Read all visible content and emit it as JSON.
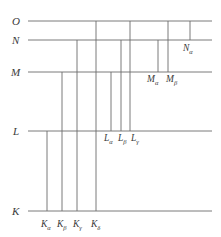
{
  "figure": {
    "type": "energy-level-transition-diagram",
    "background_color": "#ffffff",
    "line_color": "#6b6b6b",
    "text_color": "#3a3a3a"
  },
  "levels": [
    {
      "id": "O",
      "label": "O",
      "y": 21,
      "label_x": 12,
      "label_y": 16
    },
    {
      "id": "N",
      "label": "N",
      "y": 40,
      "label_x": 12,
      "label_y": 35
    },
    {
      "id": "M",
      "label": "M",
      "y": 72,
      "label_x": 11,
      "label_y": 67
    },
    {
      "id": "L",
      "label": "L",
      "y": 131,
      "label_x": 13,
      "label_y": 126
    },
    {
      "id": "K",
      "label": "K",
      "y": 211,
      "label_x": 12,
      "label_y": 206
    }
  ],
  "level_line": {
    "x_start": 28,
    "x_end": 212
  },
  "transitions": [
    {
      "id": "K-alpha",
      "series": "K",
      "greek": "α",
      "base": "K",
      "from": "L",
      "to": "K",
      "x": 47,
      "y_top": 131,
      "y_bottom": 211
    },
    {
      "id": "K-beta",
      "series": "K",
      "greek": "β",
      "base": "K",
      "from": "M",
      "to": "K",
      "x": 62,
      "y_top": 72,
      "y_bottom": 211
    },
    {
      "id": "K-gamma",
      "series": "K",
      "greek": "γ",
      "base": "K",
      "from": "N",
      "to": "K",
      "x": 77,
      "y_top": 40,
      "y_bottom": 211
    },
    {
      "id": "K-delta",
      "series": "K",
      "greek": "δ",
      "base": "K",
      "from": "O",
      "to": "K",
      "x": 96,
      "y_top": 21,
      "y_bottom": 211
    },
    {
      "id": "L-alpha",
      "series": "L",
      "greek": "α",
      "base": "L",
      "from": "M",
      "to": "L",
      "x": 111,
      "y_top": 72,
      "y_bottom": 131
    },
    {
      "id": "L-beta",
      "series": "L",
      "greek": "β",
      "base": "L",
      "from": "N",
      "to": "L",
      "x": 121,
      "y_top": 40,
      "y_bottom": 131
    },
    {
      "id": "L-gamma",
      "series": "L",
      "greek": "γ",
      "base": "L",
      "from": "O",
      "to": "L",
      "x": 130,
      "y_top": 21,
      "y_bottom": 131
    },
    {
      "id": "M-alpha",
      "series": "M",
      "greek": "α",
      "base": "M",
      "from": "N",
      "to": "M",
      "x": 158,
      "y_top": 40,
      "y_bottom": 72
    },
    {
      "id": "M-beta",
      "series": "M",
      "greek": "β",
      "base": "M",
      "from": "O",
      "to": "M",
      "x": 168,
      "y_top": 21,
      "y_bottom": 72
    },
    {
      "id": "N-alpha",
      "series": "N",
      "greek": "α",
      "base": "N",
      "from": "O",
      "to": "N",
      "x": 190,
      "y_top": 21,
      "y_bottom": 40
    }
  ],
  "transition_labels": [
    {
      "for": "K-alpha",
      "base": "K",
      "greek": "α",
      "x": 41,
      "y": 220
    },
    {
      "for": "K-beta",
      "base": "K",
      "greek": "β",
      "x": 57,
      "y": 220
    },
    {
      "for": "K-gamma",
      "base": "K",
      "greek": "γ",
      "x": 73,
      "y": 220
    },
    {
      "for": "K-delta",
      "base": "K",
      "greek": "δ",
      "x": 91,
      "y": 220
    },
    {
      "for": "L-alpha",
      "base": "L",
      "greek": "α",
      "x": 104,
      "y": 134
    },
    {
      "for": "L-beta",
      "base": "L",
      "greek": "β",
      "x": 118,
      "y": 134
    },
    {
      "for": "L-gamma",
      "base": "L",
      "greek": "γ",
      "x": 131,
      "y": 134
    },
    {
      "for": "M-alpha",
      "base": "M",
      "greek": "α",
      "x": 147,
      "y": 75
    },
    {
      "for": "M-beta",
      "base": "M",
      "greek": "β",
      "x": 166,
      "y": 75
    },
    {
      "for": "N-alpha",
      "base": "N",
      "greek": "α",
      "x": 183,
      "y": 44
    }
  ]
}
